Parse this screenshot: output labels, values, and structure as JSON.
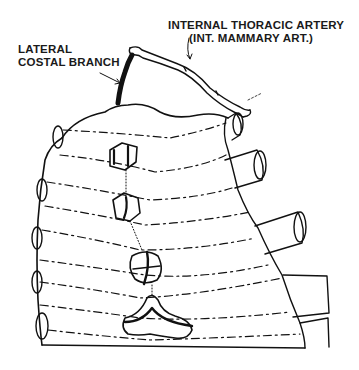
{
  "diagram": {
    "type": "anatomical line illustration",
    "labels": {
      "internal_thoracic_artery": {
        "line1": "INTERNAL THORACIC ARTERY",
        "line2": "(INT. MAMMARY ART.)"
      },
      "lateral_costal_branch": {
        "line1": "LATERAL",
        "line2": "COSTAL BRANCH"
      }
    },
    "structures": {
      "ribs_cut_ends_left": 5,
      "ribs_cut_ends_right": 5,
      "sternal_segments": 4,
      "xiphoid_process": 1
    },
    "colors": {
      "ink": "#111111",
      "background": "#ffffff"
    }
  }
}
